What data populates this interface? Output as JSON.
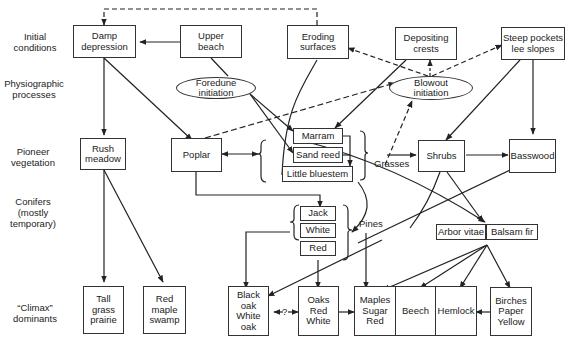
{
  "row_labels": {
    "initial": "Initial\nconditions",
    "physiographic": "Physiographic\nprocesses",
    "pioneer": "Pioneer\nvegetation",
    "conifers": "Conifers\n(mostly\ntemporary)",
    "climax": "“Climax”\ndominants"
  },
  "initial": {
    "damp_depression": "Damp\ndepression",
    "upper_beach": "Upper\nbeach",
    "eroding_surfaces": "Eroding\nsurfaces",
    "depositing_crests": "Depositing\ncrests",
    "steep_pockets": "Steep pockets\nlee slopes"
  },
  "processes": {
    "foredune": "Foredune\ninitiation",
    "blowout": "Blowout\ninitiation"
  },
  "pioneer": {
    "rush_meadow": "Rush\nmeadow",
    "poplar": "Poplar",
    "marram": "Marram",
    "sand_reed": "Sand reed",
    "little_bluestem": "Little bluestem",
    "grasses": "Grasses",
    "shrubs": "Shrubs",
    "basswood": "Basswood"
  },
  "conifers": {
    "jack": "Jack",
    "white": "White",
    "red": "Red",
    "pines": "Pines",
    "arbor_vitae": "Arbor vitae",
    "balsam_fir": "Balsam fir"
  },
  "climax": {
    "tall_grass": "Tall\ngrass\nprairie",
    "red_maple": "Red\nmaple\nswamp",
    "black_white_oak": "Black\noak\nWhite\noak",
    "question": "?",
    "oaks": "Oaks\nRed\nWhite",
    "maples": "Maples\nSugar\nRed",
    "beech": "Beech",
    "hemlock": "Hemlock",
    "birches": "Birches\nPaper\nYellow"
  }
}
